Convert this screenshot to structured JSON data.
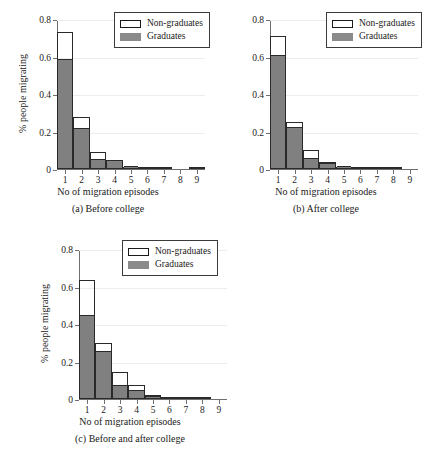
{
  "figure": {
    "background": "#ffffff",
    "bar_fill_color": "#808080",
    "bar_edge_color": "#2a2a2a",
    "axis_color": "#6f6f6f"
  },
  "legend": {
    "entries": [
      {
        "label": "Non-graduates",
        "swatch": "hollow-white-box"
      },
      {
        "label": "Graduates",
        "swatch": "filled-gray-box"
      }
    ]
  },
  "axis": {
    "ylabel": "% people migrating",
    "xlabel": "No of migration episodes",
    "yticks": [
      "0",
      "0.2",
      "0.4",
      "0.6",
      "0.8"
    ],
    "ytick_values": [
      0,
      0.2,
      0.4,
      0.6,
      0.8
    ],
    "xticks": [
      "1",
      "2",
      "3",
      "4",
      "5",
      "6",
      "7",
      "8",
      "9"
    ],
    "xtick_values": [
      1,
      2,
      3,
      4,
      5,
      6,
      7,
      8,
      9
    ],
    "ylim": [
      0,
      0.8
    ],
    "xlim": [
      0.5,
      9.5
    ]
  },
  "chart_data": [
    {
      "id": "panel-a",
      "type": "bar",
      "title": "(a) Before college",
      "caption": "(a) Before college",
      "xlabel": "No of migration episodes",
      "ylabel": "% people migrating",
      "ylim": [
        0,
        0.8
      ],
      "xlim": [
        0.5,
        9.5
      ],
      "grid": true,
      "legend_position": "top-right",
      "categories": [
        1,
        2,
        3,
        4,
        5,
        6,
        7,
        8,
        9
      ],
      "series": [
        {
          "name": "Non-graduates",
          "values": [
            0.73,
            0.28,
            0.09,
            0.05,
            0.005,
            0.004,
            0.004,
            0.0,
            0.006
          ]
        },
        {
          "name": "Graduates",
          "values": [
            0.575,
            0.21,
            0.045,
            0.035,
            0.004,
            0.0,
            0.0,
            0.0,
            0.0
          ]
        }
      ]
    },
    {
      "id": "panel-b",
      "type": "bar",
      "title": "(b) After college",
      "caption": "(b) After college",
      "xlabel": "No of migration episodes",
      "ylabel": "% people migrating",
      "ylim": [
        0,
        0.8
      ],
      "xlim": [
        0.5,
        9.5
      ],
      "grid": true,
      "legend_position": "top-right",
      "categories": [
        1,
        2,
        3,
        4,
        5,
        6,
        7,
        8,
        9
      ],
      "series": [
        {
          "name": "Non-graduates",
          "values": [
            0.71,
            0.25,
            0.1,
            0.04,
            0.012,
            0.006,
            0.006,
            0.006,
            0.0
          ]
        },
        {
          "name": "Graduates",
          "values": [
            0.6,
            0.215,
            0.05,
            0.02,
            0.006,
            0.0,
            0.0,
            0.0,
            0.0
          ]
        }
      ]
    },
    {
      "id": "panel-c",
      "type": "bar",
      "title": "(c) Before and after college",
      "caption": "(c) Before and after college",
      "xlabel": "No of migration episodes",
      "ylabel": "% people migrating",
      "ylim": [
        0,
        0.8
      ],
      "xlim": [
        0.5,
        9.5
      ],
      "grid": true,
      "legend_position": "top-right",
      "categories": [
        1,
        2,
        3,
        4,
        5,
        6,
        7,
        8,
        9
      ],
      "series": [
        {
          "name": "Non-graduates",
          "values": [
            0.635,
            0.3,
            0.145,
            0.075,
            0.02,
            0.008,
            0.008,
            0.008,
            0.0
          ]
        },
        {
          "name": "Graduates",
          "values": [
            0.44,
            0.245,
            0.065,
            0.04,
            0.008,
            0.0,
            0.0,
            0.0,
            0.0
          ]
        }
      ]
    }
  ]
}
